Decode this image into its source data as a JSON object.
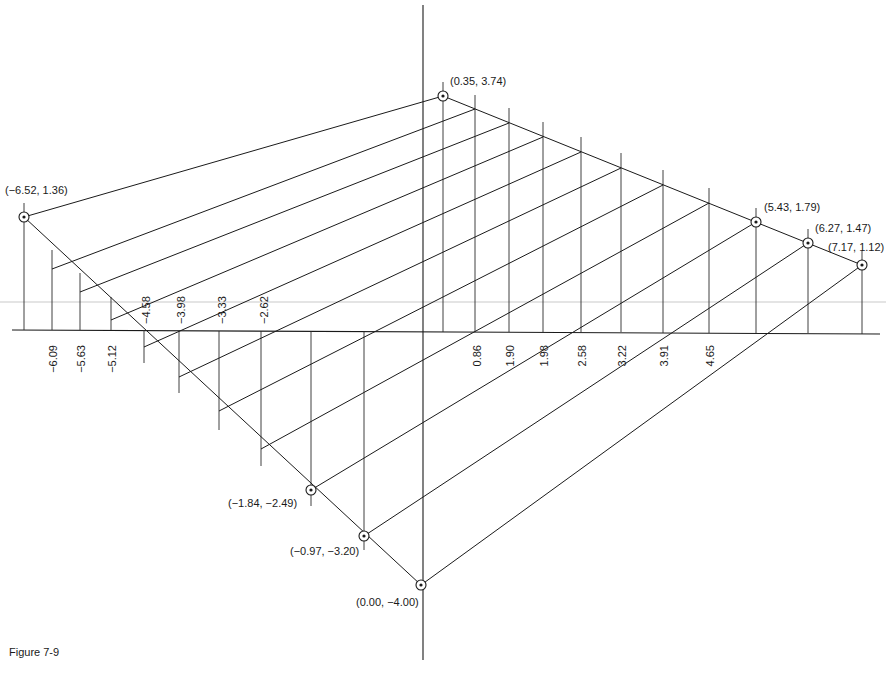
{
  "figure": {
    "caption": "Figure 7-9"
  },
  "axes": {
    "horizontal": {
      "x1": 12,
      "y1": 330,
      "x2": 880,
      "y2": 334
    },
    "vertical": {
      "x1": 423,
      "y1": 5,
      "x2": 423,
      "y2": 660
    }
  },
  "points": [
    {
      "label": "(-6.52, 1.36)",
      "x": 24,
      "y": 217,
      "lx": 5,
      "ly": 194
    },
    {
      "label": "(0.35, 3.74)",
      "x": 443,
      "y": 96,
      "lx": 450,
      "ly": 85
    },
    {
      "label": "(5.43, 1.79)",
      "x": 756,
      "y": 222,
      "lx": 764,
      "ly": 211
    },
    {
      "label": "(6.27, 1.47)",
      "x": 808,
      "y": 243,
      "lx": 815,
      "ly": 232
    },
    {
      "label": "(7.17, 1.12)",
      "x": 862,
      "y": 265,
      "lx": 828,
      "ly": 251
    },
    {
      "label": "(-1.84, -2.49)",
      "x": 311,
      "y": 490,
      "lx": 228,
      "ly": 507
    },
    {
      "label": "(-0.97, -3.20)",
      "x": 364,
      "y": 536,
      "lx": 290,
      "ly": 555
    },
    {
      "label": "(0.00, -4.00)",
      "x": 421,
      "y": 585,
      "lx": 356,
      "ly": 606
    }
  ],
  "tick_labels": {
    "below_axis": [
      {
        "text": "-6.09",
        "x": 57,
        "y": 345
      },
      {
        "text": "-5.63",
        "x": 85,
        "y": 345
      },
      {
        "text": "-5.12",
        "x": 116,
        "y": 345
      },
      {
        "text": "0.86",
        "x": 481,
        "y": 345
      },
      {
        "text": "1.90",
        "x": 514,
        "y": 345
      },
      {
        "text": "1.98",
        "x": 548,
        "y": 345
      },
      {
        "text": "2.58",
        "x": 586,
        "y": 345
      },
      {
        "text": "3.22",
        "x": 626,
        "y": 345
      },
      {
        "text": "3.91",
        "x": 668,
        "y": 345
      },
      {
        "text": "4.65",
        "x": 714,
        "y": 345
      }
    ],
    "above_axis": [
      {
        "text": "-4.58",
        "x": 150,
        "y": 324
      },
      {
        "text": "-3.98",
        "x": 185,
        "y": 324
      },
      {
        "text": "-3.33",
        "x": 226,
        "y": 324
      },
      {
        "text": "-2.62",
        "x": 268,
        "y": 324
      }
    ]
  },
  "edges": [
    {
      "name": "top-left-edge",
      "x1": 24,
      "y1": 217,
      "x2": 443,
      "y2": 96
    },
    {
      "name": "top-right-edge",
      "x1": 443,
      "y1": 96,
      "x2": 862,
      "y2": 265
    },
    {
      "name": "bottom-left-edge",
      "x1": 24,
      "y1": 217,
      "x2": 421,
      "y2": 585
    }
  ],
  "parallels": [
    {
      "x1": 52,
      "y1": 269,
      "x2": 475,
      "y2": 109
    },
    {
      "x1": 80,
      "y1": 292,
      "x2": 509,
      "y2": 123
    },
    {
      "x1": 111,
      "y1": 320,
      "x2": 543,
      "y2": 137
    },
    {
      "x1": 144,
      "y1": 347,
      "x2": 581,
      "y2": 152
    },
    {
      "x1": 179,
      "y1": 377,
      "x2": 621,
      "y2": 168
    },
    {
      "x1": 219,
      "y1": 411,
      "x2": 663,
      "y2": 185
    },
    {
      "x1": 261,
      "y1": 449,
      "x2": 709,
      "y2": 203
    },
    {
      "x1": 311,
      "y1": 490,
      "x2": 756,
      "y2": 222
    },
    {
      "x1": 364,
      "y1": 536,
      "x2": 808,
      "y2": 243
    },
    {
      "x1": 421,
      "y1": 585,
      "x2": 862,
      "y2": 265
    }
  ],
  "verticals": [
    {
      "x": 24,
      "y1": 203,
      "y2": 330
    },
    {
      "x": 52,
      "y1": 250,
      "y2": 330
    },
    {
      "x": 80,
      "y1": 273,
      "y2": 330
    },
    {
      "x": 111,
      "y1": 297,
      "y2": 330
    },
    {
      "x": 144,
      "y1": 330,
      "y2": 363
    },
    {
      "x": 179,
      "y1": 331,
      "y2": 393
    },
    {
      "x": 219,
      "y1": 331,
      "y2": 430
    },
    {
      "x": 261,
      "y1": 331,
      "y2": 466
    },
    {
      "x": 311,
      "y1": 331,
      "y2": 506
    },
    {
      "x": 364,
      "y1": 332,
      "y2": 550
    },
    {
      "x": 443,
      "y1": 82,
      "y2": 332
    },
    {
      "x": 475,
      "y1": 95,
      "y2": 332
    },
    {
      "x": 509,
      "y1": 108,
      "y2": 332
    },
    {
      "x": 543,
      "y1": 122,
      "y2": 332
    },
    {
      "x": 581,
      "y1": 137,
      "y2": 332
    },
    {
      "x": 621,
      "y1": 153,
      "y2": 332
    },
    {
      "x": 663,
      "y1": 170,
      "y2": 333
    },
    {
      "x": 709,
      "y1": 188,
      "y2": 333
    },
    {
      "x": 756,
      "y1": 208,
      "y2": 333
    },
    {
      "x": 808,
      "y1": 229,
      "y2": 333
    },
    {
      "x": 862,
      "y1": 251,
      "y2": 334
    }
  ]
}
